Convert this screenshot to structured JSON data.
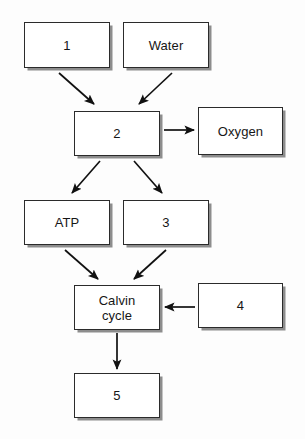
{
  "diagram": {
    "type": "flowchart",
    "canvas": {
      "width": 305,
      "height": 439,
      "background": "#fdfdfd"
    },
    "style": {
      "box_fill": "#ffffff",
      "box_border_color": "#2b2b2b",
      "box_shadow_color": "#8d8d8d",
      "arrow_color": "#111111",
      "text_color": "#161616"
    },
    "nodes": [
      {
        "id": "n1",
        "label": "1",
        "x": 24,
        "y": 22,
        "w": 86,
        "h": 46
      },
      {
        "id": "water",
        "label": "Water",
        "x": 123,
        "y": 22,
        "w": 86,
        "h": 46
      },
      {
        "id": "n2",
        "label": "2",
        "x": 74,
        "y": 111,
        "w": 86,
        "h": 45
      },
      {
        "id": "oxygen",
        "label": "Oxygen",
        "x": 198,
        "y": 107,
        "w": 85,
        "h": 48
      },
      {
        "id": "atp",
        "label": "ATP",
        "x": 24,
        "y": 200,
        "w": 86,
        "h": 45
      },
      {
        "id": "n3",
        "label": "3",
        "x": 123,
        "y": 200,
        "w": 86,
        "h": 45
      },
      {
        "id": "calvin",
        "label": "Calvin\ncycle",
        "x": 74,
        "y": 285,
        "w": 86,
        "h": 45
      },
      {
        "id": "n4",
        "label": "4",
        "x": 198,
        "y": 283,
        "w": 85,
        "h": 45
      },
      {
        "id": "n5",
        "label": "5",
        "x": 74,
        "y": 373,
        "w": 86,
        "h": 45
      }
    ],
    "edges": [
      {
        "id": "e1",
        "from": "n1",
        "to": "n2",
        "kind": "diagonal-down-right"
      },
      {
        "id": "e2",
        "from": "water",
        "to": "n2",
        "kind": "diagonal-down-left"
      },
      {
        "id": "e3",
        "from": "n2",
        "to": "oxygen",
        "kind": "horizontal-right"
      },
      {
        "id": "e4",
        "from": "n2",
        "to": "atp",
        "kind": "diagonal-down-left"
      },
      {
        "id": "e5",
        "from": "n2",
        "to": "n3",
        "kind": "diagonal-down-right"
      },
      {
        "id": "e6",
        "from": "atp",
        "to": "calvin",
        "kind": "diagonal-down-right"
      },
      {
        "id": "e7",
        "from": "n3",
        "to": "calvin",
        "kind": "diagonal-down-left"
      },
      {
        "id": "e8",
        "from": "n4",
        "to": "calvin",
        "kind": "horizontal-left"
      },
      {
        "id": "e9",
        "from": "calvin",
        "to": "n5",
        "kind": "vertical-down"
      }
    ]
  }
}
